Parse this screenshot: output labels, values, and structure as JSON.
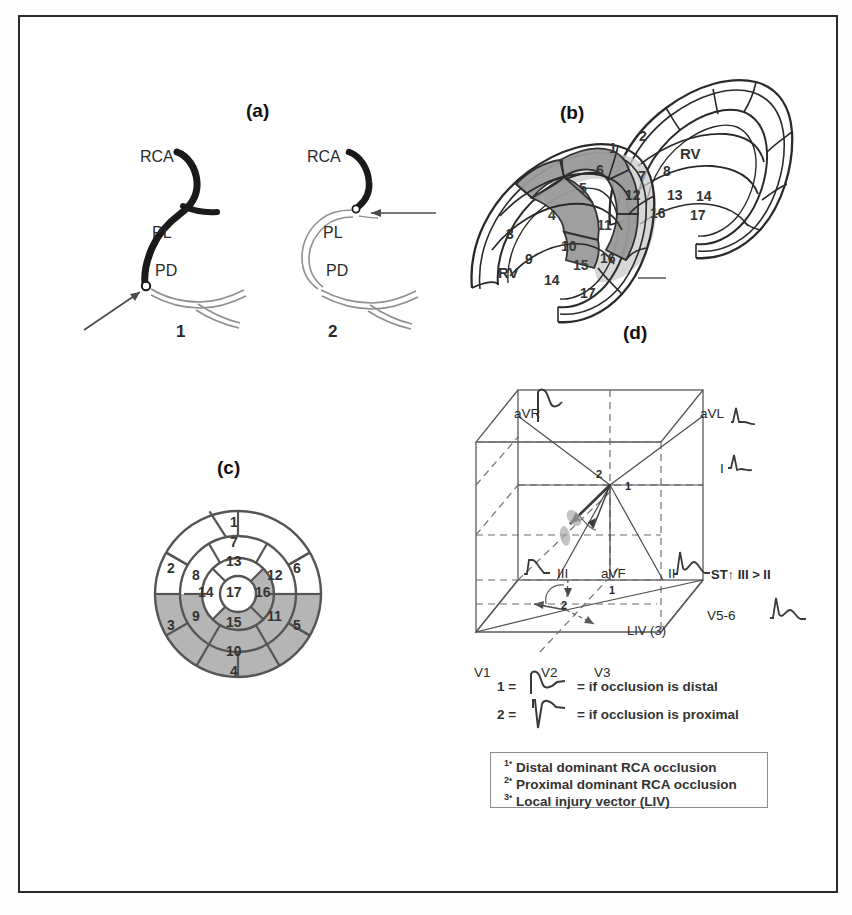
{
  "figure": {
    "background": "#ffffff",
    "border_color": "#2b2b2b",
    "ink": "#2a2a2a",
    "shade_dark": "#9a9a9a",
    "shade_light": "#c9c9c9"
  },
  "panels": {
    "a": {
      "label": "(a)",
      "sub1_label": "1",
      "sub2_label": "2",
      "artery_labels": {
        "rca": "RCA",
        "pl": "PL",
        "pd": "PD"
      },
      "sub1": {
        "rca": "RCA",
        "pl": "PL",
        "pd": "PD"
      },
      "sub2": {
        "rca": "RCA",
        "pl": "PL",
        "pd": "PD"
      }
    },
    "b": {
      "label": "(b)",
      "rv_label": "RV",
      "left_view_segments": [
        "3",
        "4",
        "5",
        "9",
        "10",
        "11",
        "14",
        "15",
        "16",
        "17"
      ],
      "right_view_segments": [
        "1",
        "2",
        "6",
        "7",
        "8",
        "12",
        "13",
        "14",
        "16",
        "17"
      ],
      "shaded_segments": [
        "4",
        "5",
        "10",
        "11",
        "15",
        "16"
      ]
    },
    "c": {
      "label": "(c)",
      "rings": {
        "basal": [
          "1",
          "2",
          "3",
          "4",
          "5",
          "6"
        ],
        "mid": [
          "7",
          "8",
          "9",
          "10",
          "11",
          "12"
        ],
        "apical": [
          "13",
          "14",
          "15",
          "16"
        ],
        "apex": [
          "17"
        ]
      },
      "shaded_segments": [
        "3",
        "4",
        "5",
        "9",
        "10",
        "11",
        "15",
        "16"
      ]
    },
    "d": {
      "label": "(d)",
      "lead_labels": {
        "aVR": "aVR",
        "aVL": "aVL",
        "I": "I",
        "II": "II",
        "III": "III",
        "aVF": "aVF",
        "V1": "V1",
        "V2": "V2",
        "V3": "V3",
        "V5_6": "V5-6"
      },
      "annotations": {
        "st_criterion": "ST↑ III > II",
        "liv": "LIV (3)",
        "vector_1": "1",
        "vector_2": "2",
        "vector_1_lower": "1",
        "vector_2_lower": "2"
      },
      "key": [
        {
          "num": "1 =",
          "text": "= if occlusion is distal"
        },
        {
          "num": "2 =",
          "text": "= if occlusion is proximal"
        }
      ],
      "legend": [
        {
          "sup": "1",
          "mark": "•",
          "text": "Distal dominant RCA occlusion"
        },
        {
          "sup": "2",
          "mark": "•",
          "text": "Proximal dominant RCA occlusion"
        },
        {
          "sup": "3",
          "mark": "•",
          "text": "Local injury vector (LIV)"
        }
      ]
    }
  }
}
